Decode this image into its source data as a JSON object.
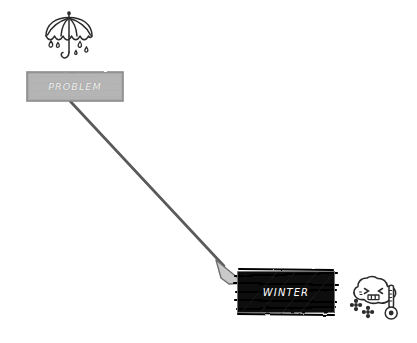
{
  "diagram": {
    "background_color": "#ffffff",
    "style": "hand-drawn sketch",
    "nodes": [
      {
        "id": "problem",
        "label": "PROBLEM",
        "fill_color": "#b5b5b5",
        "stroke_color": "#8a8a8a",
        "text_color": "#f2f2f2",
        "x": 27,
        "y": 72,
        "width": 96,
        "height": 29,
        "icon": "umbrella-rain-icon"
      },
      {
        "id": "winter",
        "label": "WINTER",
        "fill_color": "#0d0d0d",
        "stroke_color": "#000000",
        "text_color": "#ffffff",
        "x": 237,
        "y": 271,
        "width": 98,
        "height": 42,
        "icon": "cold-cloud-thermometer-icon"
      }
    ],
    "edges": [
      {
        "id": "problem-to-winter",
        "from": "problem",
        "to": "winter",
        "label": "",
        "stroke_color": "#565656",
        "arrowhead_fill": "#c9c9c9",
        "arrowhead_stroke": "#6e6e6e"
      }
    ],
    "icons": {
      "umbrella": {
        "name": "umbrella-rain-icon",
        "stroke_color": "#2b2b2b",
        "raindrop_count": 5
      },
      "winter_face": {
        "name": "cold-cloud-thermometer-icon",
        "stroke_color": "#2b2b2b",
        "snowflake_count": 2,
        "expression": "shivering"
      }
    }
  }
}
